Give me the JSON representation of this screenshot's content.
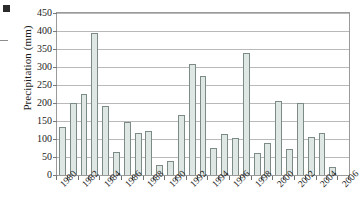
{
  "chart_data": {
    "type": "bar",
    "title": "",
    "subtitle": "",
    "xlabel": "",
    "ylabel": "Precipitation (mm)",
    "ylim": [
      0,
      450
    ],
    "ytick_step": 50,
    "yticks": [
      0,
      50,
      100,
      150,
      200,
      250,
      300,
      350,
      400,
      450
    ],
    "grid": "horizontal",
    "legend": "none",
    "categories": [
      "1980",
      "1981",
      "1982",
      "1983",
      "1984",
      "1985",
      "1986",
      "1987",
      "1988",
      "1989",
      "1990",
      "1991",
      "1992",
      "1993",
      "1994",
      "1995",
      "1996",
      "1997",
      "1998",
      "1999",
      "2000",
      "2001",
      "2002",
      "2003",
      "2004",
      "2005",
      "2006"
    ],
    "values": [
      132,
      200,
      225,
      395,
      192,
      63,
      147,
      117,
      123,
      27,
      39,
      167,
      307,
      276,
      74,
      114,
      104,
      338,
      62,
      88,
      205,
      73,
      199,
      105,
      117,
      22,
      0
    ],
    "xtick_labels": [
      "1980",
      "1982",
      "1984",
      "1986",
      "1988",
      "1990",
      "1992",
      "1994",
      "1996",
      "1998",
      "2000",
      "2002",
      "2004",
      "2006"
    ],
    "xtick_indices": [
      0,
      2,
      4,
      6,
      8,
      10,
      12,
      14,
      16,
      18,
      20,
      22,
      24,
      26
    ],
    "bar_fill_color": "#dfe7e4",
    "bar_edge_color": "#7c8b88",
    "grid_color": "#b9b9b9",
    "axis_color": "#9a9a9a"
  },
  "figure": {
    "corner_mark_label": "page-edge-marker",
    "edge_tick_label": "page-edge-tick"
  }
}
